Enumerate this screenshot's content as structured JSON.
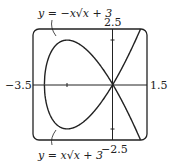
{
  "graph": {
    "x_min_label": "−3.5",
    "x_max_label": "1.5",
    "y_max_label": "2.5",
    "y_min_label": "−2.5",
    "curve_top_label": "y = −x√x + 3",
    "curve_bottom_label": "y = x√x + 3",
    "line_color": "#222222"
  },
  "chart_data": {
    "type": "line",
    "title": "",
    "xlim": [
      -3.5,
      1.5
    ],
    "ylim": [
      -2.5,
      2.5
    ],
    "series": [
      {
        "name": "y = -x*sqrt(x+3)",
        "function": "-x*sqrt(x+3)",
        "domain": [
          -3,
          1.5
        ]
      },
      {
        "name": "y = x*sqrt(x+3)",
        "function": "x*sqrt(x+3)",
        "domain": [
          -3,
          1.5
        ]
      }
    ],
    "axis_ticks": {
      "x": [
        -2,
        0
      ],
      "y": [
        -2,
        0,
        2
      ]
    }
  }
}
